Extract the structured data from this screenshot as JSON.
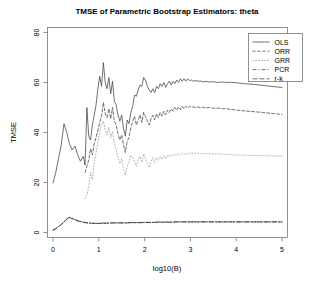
{
  "chart_data": {
    "type": "line",
    "title": "TMSE of Parametric Bootstrap Estimators: theta",
    "xlabel": "log10(B)",
    "ylabel": "TMSE",
    "xlim": [
      -0.12,
      5.12
    ],
    "ylim": [
      -2,
      82
    ],
    "xticks": [
      0,
      1,
      2,
      3,
      4,
      5
    ],
    "yticks": [
      0,
      20,
      40,
      60,
      80
    ],
    "grid": false,
    "legend_position": "top-right",
    "legend_entries": [
      {
        "name": "OLS",
        "dash": "none"
      },
      {
        "name": "ORR",
        "dash": "dashed"
      },
      {
        "name": "GRR",
        "dash": "dotted"
      },
      {
        "name": "PCR",
        "dash": "dashdot"
      },
      {
        "name": "r-k",
        "dash": "longdash"
      }
    ],
    "series": [
      {
        "name": "OLS",
        "dash": "none",
        "color": "#4d4d4d",
        "x": [
          0.0,
          0.06,
          0.12,
          0.18,
          0.24,
          0.3,
          0.36,
          0.42,
          0.48,
          0.54,
          0.6,
          0.66,
          0.7,
          0.74,
          0.78,
          0.82,
          0.86,
          0.9,
          0.94,
          0.98,
          1.02,
          1.06,
          1.1,
          1.14,
          1.18,
          1.22,
          1.26,
          1.3,
          1.34,
          1.38,
          1.42,
          1.46,
          1.5,
          1.54,
          1.58,
          1.62,
          1.66,
          1.7,
          1.74,
          1.78,
          1.82,
          1.86,
          1.9,
          1.94,
          1.98,
          2.02,
          2.06,
          2.1,
          2.14,
          2.18,
          2.22,
          2.26,
          2.3,
          2.34,
          2.38,
          2.42,
          2.46,
          2.5,
          2.54,
          2.58,
          2.62,
          2.66,
          2.7,
          2.74,
          2.78,
          2.82,
          2.86,
          2.9,
          2.94,
          2.98,
          3.02,
          3.06,
          3.1,
          3.16,
          3.22,
          3.28,
          3.34,
          3.4,
          3.5,
          3.6,
          3.7,
          3.8,
          3.9,
          4.0,
          4.2,
          4.4,
          4.6,
          4.8,
          5.0
        ],
        "y": [
          19.8,
          24.0,
          29.5,
          35.0,
          43.5,
          40.0,
          35.5,
          33.0,
          34.5,
          31.0,
          28.5,
          30.5,
          27.0,
          50.0,
          38.5,
          37.0,
          43.0,
          47.0,
          51.0,
          57.5,
          62.5,
          58.5,
          68.0,
          60.0,
          57.5,
          62.0,
          55.5,
          60.5,
          52.5,
          51.0,
          47.0,
          44.5,
          47.0,
          41.5,
          38.5,
          45.0,
          43.5,
          48.0,
          50.5,
          55.0,
          54.5,
          57.0,
          59.0,
          58.5,
          62.0,
          61.0,
          58.5,
          57.0,
          56.0,
          57.5,
          56.0,
          58.5,
          57.5,
          59.5,
          58.5,
          60.0,
          58.0,
          59.5,
          60.5,
          59.0,
          60.5,
          59.5,
          61.0,
          60.0,
          61.5,
          60.5,
          61.5,
          60.5,
          61.5,
          60.8,
          61.0,
          60.5,
          60.8,
          60.5,
          60.6,
          60.3,
          60.5,
          60.2,
          60.3,
          60.0,
          60.2,
          60.0,
          60.1,
          59.9,
          59.5,
          59.2,
          58.8,
          58.4,
          58.0
        ]
      },
      {
        "name": "ORR",
        "dash": "dashed",
        "color": "#4d4d4d",
        "x": [
          0.7,
          0.74,
          0.78,
          0.82,
          0.86,
          0.9,
          0.94,
          0.98,
          1.02,
          1.06,
          1.1,
          1.14,
          1.18,
          1.22,
          1.26,
          1.3,
          1.34,
          1.38,
          1.42,
          1.46,
          1.5,
          1.54,
          1.58,
          1.62,
          1.66,
          1.7,
          1.74,
          1.78,
          1.82,
          1.86,
          1.9,
          1.94,
          1.98,
          2.02,
          2.06,
          2.1,
          2.14,
          2.18,
          2.22,
          2.26,
          2.3,
          2.34,
          2.38,
          2.42,
          2.46,
          2.5,
          2.54,
          2.58,
          2.62,
          2.66,
          2.7,
          2.74,
          2.78,
          2.82,
          2.86,
          2.9,
          2.94,
          2.98,
          3.02,
          3.06,
          3.1,
          3.16,
          3.22,
          3.28,
          3.34,
          3.4,
          3.5,
          3.6,
          3.7,
          3.8,
          3.9,
          4.0,
          4.2,
          4.4,
          4.6,
          4.8,
          5.0
        ],
        "y": [
          24.0,
          26.5,
          29.0,
          33.5,
          31.0,
          35.5,
          38.0,
          41.0,
          44.0,
          46.5,
          52.0,
          47.5,
          46.0,
          49.5,
          45.5,
          50.0,
          44.5,
          43.0,
          39.5,
          37.0,
          39.0,
          35.0,
          32.0,
          36.5,
          38.0,
          42.0,
          44.5,
          46.5,
          43.0,
          45.0,
          47.0,
          44.0,
          48.0,
          46.5,
          44.5,
          43.0,
          45.5,
          47.0,
          45.0,
          47.5,
          46.0,
          48.0,
          46.5,
          48.5,
          47.0,
          49.0,
          48.0,
          49.5,
          48.5,
          50.0,
          49.0,
          50.2,
          49.2,
          50.5,
          49.5,
          50.5,
          49.8,
          50.5,
          50.0,
          50.3,
          50.0,
          50.2,
          49.9,
          50.1,
          49.8,
          50.0,
          49.7,
          49.8,
          49.5,
          49.5,
          49.2,
          49.0,
          48.6,
          48.3,
          48.0,
          47.6,
          47.2
        ]
      },
      {
        "name": "GRR",
        "dash": "dotted",
        "color": "#a0a0a0",
        "x": [
          0.7,
          0.74,
          0.78,
          0.82,
          0.86,
          0.9,
          0.94,
          0.98,
          1.02,
          1.06,
          1.1,
          1.14,
          1.18,
          1.22,
          1.26,
          1.3,
          1.34,
          1.38,
          1.42,
          1.46,
          1.5,
          1.54,
          1.58,
          1.62,
          1.66,
          1.7,
          1.74,
          1.78,
          1.82,
          1.86,
          1.9,
          1.94,
          1.98,
          2.02,
          2.06,
          2.1,
          2.14,
          2.18,
          2.22,
          2.26,
          2.3,
          2.34,
          2.38,
          2.42,
          2.46,
          2.5,
          2.54,
          2.58,
          2.62,
          2.66,
          2.7,
          2.74,
          2.78,
          2.82,
          2.86,
          2.9,
          2.94,
          2.98,
          3.02,
          3.06,
          3.1,
          3.16,
          3.22,
          3.28,
          3.34,
          3.4,
          3.5,
          3.6,
          3.7,
          3.8,
          3.9,
          4.0,
          4.2,
          4.4,
          4.6,
          4.8,
          5.0
        ],
        "y": [
          13.5,
          15.0,
          18.5,
          24.0,
          21.0,
          28.0,
          32.0,
          36.0,
          40.5,
          43.0,
          44.5,
          41.0,
          39.0,
          42.0,
          38.0,
          40.5,
          35.5,
          33.0,
          30.0,
          27.5,
          29.5,
          25.5,
          23.0,
          26.5,
          28.5,
          31.0,
          30.0,
          28.5,
          26.5,
          29.0,
          30.5,
          28.0,
          31.5,
          29.5,
          27.5,
          26.0,
          28.5,
          30.0,
          28.0,
          30.0,
          28.8,
          30.5,
          29.2,
          30.8,
          29.5,
          31.0,
          30.2,
          31.2,
          30.5,
          31.5,
          30.8,
          31.5,
          31.0,
          31.8,
          31.2,
          31.8,
          31.3,
          31.9,
          31.5,
          31.8,
          31.5,
          31.8,
          31.5,
          31.7,
          31.4,
          31.6,
          31.4,
          31.5,
          31.3,
          31.3,
          31.1,
          31.0,
          30.9,
          30.8,
          30.7,
          30.6,
          30.5
        ]
      },
      {
        "name": "PCR",
        "dash": "dashdot",
        "color": "#3a3a3a",
        "x": [
          0.0,
          0.06,
          0.12,
          0.18,
          0.24,
          0.3,
          0.36,
          0.42,
          0.48,
          0.54,
          0.6,
          0.66,
          0.72,
          0.78,
          0.84,
          0.9,
          0.96,
          1.02,
          1.1,
          1.2,
          1.3,
          1.4,
          1.5,
          1.6,
          1.7,
          1.8,
          1.9,
          2.0,
          2.1,
          2.2,
          2.3,
          2.4,
          2.5,
          2.6,
          2.7,
          2.8,
          2.9,
          3.0,
          3.2,
          3.4,
          3.6,
          3.8,
          4.0,
          4.3,
          4.6,
          5.0
        ],
        "y": [
          1.0,
          1.6,
          2.4,
          3.2,
          4.3,
          5.5,
          6.1,
          5.7,
          5.2,
          4.8,
          4.5,
          4.2,
          4.0,
          3.8,
          3.8,
          3.7,
          3.7,
          3.7,
          3.8,
          3.8,
          3.9,
          3.9,
          3.9,
          3.9,
          4.0,
          4.0,
          4.0,
          4.1,
          4.1,
          4.1,
          4.2,
          4.2,
          4.2,
          4.2,
          4.3,
          4.3,
          4.3,
          4.3,
          4.3,
          4.3,
          4.3,
          4.3,
          4.3,
          4.3,
          4.3,
          4.3
        ]
      },
      {
        "name": "r-k",
        "dash": "longdash",
        "color": "#3a3a3a",
        "x": [
          0.0,
          0.06,
          0.12,
          0.18,
          0.24,
          0.3,
          0.36,
          0.42,
          0.48,
          0.54,
          0.6,
          0.66,
          0.72,
          0.78,
          0.84,
          0.9,
          0.96,
          1.02,
          1.1,
          1.2,
          1.3,
          1.4,
          1.5,
          1.6,
          1.7,
          1.8,
          1.9,
          2.0,
          2.1,
          2.2,
          2.3,
          2.4,
          2.5,
          2.6,
          2.7,
          2.8,
          2.9,
          3.0,
          3.2,
          3.4,
          3.6,
          3.8,
          4.0,
          4.3,
          4.6,
          5.0
        ],
        "y": [
          0.9,
          1.5,
          2.3,
          3.1,
          4.1,
          5.3,
          5.9,
          5.5,
          5.0,
          4.6,
          4.3,
          4.0,
          3.9,
          3.7,
          3.7,
          3.6,
          3.6,
          3.6,
          3.7,
          3.7,
          3.8,
          3.8,
          3.8,
          3.8,
          3.9,
          3.9,
          3.9,
          4.0,
          4.0,
          4.0,
          4.1,
          4.1,
          4.1,
          4.1,
          4.2,
          4.2,
          4.2,
          4.2,
          4.2,
          4.2,
          4.2,
          4.2,
          4.2,
          4.2,
          4.2,
          4.2
        ]
      }
    ]
  }
}
